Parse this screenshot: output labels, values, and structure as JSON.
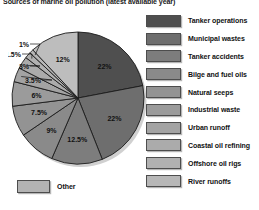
{
  "chart_data": {
    "type": "pie",
    "title": "Sources of marine oil pollution (latest available year)",
    "xlabel": "",
    "ylabel": "",
    "units": "percent",
    "legend_position": "right",
    "grid": false,
    "categories": [
      "Tanker operations",
      "Municipal wastes",
      "Tanker accidents",
      "Bilge and fuel oils",
      "Natural seeps",
      "Industrial waste",
      "Urban runoff",
      "Coastal oil refining",
      "Offshore oil rigs",
      "River runoffs",
      "Other"
    ],
    "values": [
      22,
      22,
      12.5,
      9,
      7.5,
      6,
      3.5,
      3,
      1.5,
      1,
      12
    ],
    "labels": [
      "22%",
      "22%",
      "12.5%",
      "9%",
      "7.5%",
      "6%",
      "3.5%",
      "3%",
      "1.5%",
      "1%",
      "12%"
    ],
    "colors": [
      "#4f4f4f",
      "#6e6e6e",
      "#7d7d7d",
      "#8a8a8a",
      "#939393",
      "#9b9b9b",
      "#a3a3a3",
      "#ababab",
      "#b1b1b1",
      "#b7b7b7",
      "#bdbdbd"
    ],
    "start_angle_deg": 0,
    "direction": "clockwise"
  },
  "legend": {
    "items": [
      {
        "label": "Tanker operations",
        "color": "#4f4f4f"
      },
      {
        "label": "Municipal wastes",
        "color": "#6e6e6e"
      },
      {
        "label": "Tanker accidents",
        "color": "#7d7d7d"
      },
      {
        "label": "Bilge and fuel oils",
        "color": "#8a8a8a"
      },
      {
        "label": "Natural seeps",
        "color": "#939393"
      },
      {
        "label": "Industrial waste",
        "color": "#9b9b9b"
      },
      {
        "label": "Urban runoff",
        "color": "#a3a3a3"
      },
      {
        "label": "Coastal oil refining",
        "color": "#ababab"
      },
      {
        "label": "Offshore oil rigs",
        "color": "#b1b1b1"
      },
      {
        "label": "River runoffs",
        "color": "#b7b7b7"
      }
    ],
    "other": {
      "label": "Other",
      "color": "#b3b3b3"
    }
  }
}
